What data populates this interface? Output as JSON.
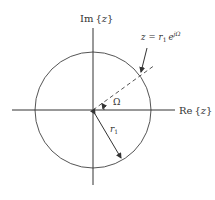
{
  "diagram": {
    "axes": {
      "imag_label": "Im{z}",
      "imag_label_parts": {
        "name": "Im",
        "open": "{",
        "var": "z",
        "close": "}"
      },
      "real_label": "Re{z}",
      "real_label_parts": {
        "name": "Re",
        "open": "{",
        "var": "z",
        "close": "}"
      }
    },
    "point_label": {
      "text": "z = r1 e^{jΩ}",
      "lhs": "z",
      "eq": "=",
      "r": "r",
      "r_sub": "1",
      "e": "e",
      "exp": "jΩ"
    },
    "angle_label": "Ω",
    "radius_label": {
      "r": "r",
      "sub": "1"
    },
    "colors": {
      "stroke": "#444444",
      "text": "#333333",
      "background": "#ffffff"
    }
  }
}
